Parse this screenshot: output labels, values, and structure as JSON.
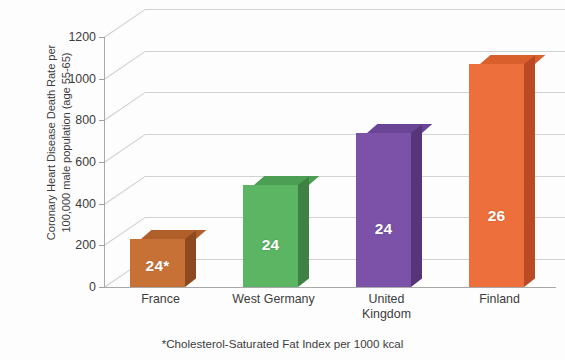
{
  "chart_data": {
    "type": "bar",
    "title": "",
    "subtitle": "",
    "xlabel": "",
    "ylabel": "Coronary Heart Disease Death Rate per 100,000 male population (age 55-65)",
    "ylabel_lines": [
      "Coronary Heart Disease Death Rate per",
      "100,000 male population (age 55-65)"
    ],
    "categories": [
      "France",
      "West Germany",
      "United Kingdom",
      "Finland"
    ],
    "category_label_lines": [
      [
        "France"
      ],
      [
        "West Germany"
      ],
      [
        "United",
        "Kingdom"
      ],
      [
        "Finland"
      ]
    ],
    "values": [
      230,
      490,
      740,
      1070
    ],
    "data_labels": [
      "24*",
      "24",
      "24",
      "26"
    ],
    "data_label_meaning": "Cholesterol-Saturated Fat Index per 1000 kcal",
    "bar_colors": [
      "#c87137",
      "#5bb563",
      "#7b52a8",
      "#ec6f3c"
    ],
    "bar_colors_top": [
      "#b05f2b",
      "#4c9e55",
      "#6a4596",
      "#d95f2d"
    ],
    "bar_colors_side": [
      "#8d4a21",
      "#3d8244",
      "#563579",
      "#b94a24"
    ],
    "ylim": [
      0,
      1200
    ],
    "yticks": [
      0,
      200,
      400,
      600,
      800,
      1000,
      1200
    ],
    "ytick_labels": [
      "0",
      "200",
      "400",
      "600",
      "800",
      "1000",
      "1200"
    ],
    "grid": true,
    "grid_axis": "y",
    "legend": false,
    "three_d": true,
    "footnote": "*Cholesterol-Saturated Fat Index per 1000 kcal"
  },
  "footnote": {
    "text": "*Cholesterol-Saturated Fat Index per 1000 kcal"
  }
}
